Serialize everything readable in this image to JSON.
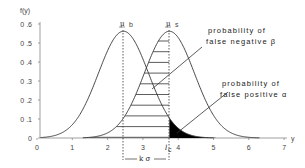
{
  "chart_data": {
    "type": "line",
    "title": "",
    "xlabel": "y",
    "ylabel": "f(y)",
    "xlim": [
      0,
      7
    ],
    "ylim": [
      0,
      0.6
    ],
    "x_ticks": [
      "0",
      "1",
      "2",
      "3",
      "4",
      "5",
      "6",
      "7"
    ],
    "y_ticks": [
      "0",
      "0.1",
      "0.2",
      "0.3",
      "0.4",
      "0.5",
      "0.6"
    ],
    "grid": false,
    "series": [
      {
        "name": "background distribution (mu b)",
        "mean": 2.45,
        "sd": 0.71,
        "peak": 0.56
      },
      {
        "name": "signal distribution (mu s)",
        "mean": 3.75,
        "sd": 0.71,
        "peak": 0.56
      }
    ],
    "critical_level": 3.75,
    "annotations": {
      "mu_b_label": "μ",
      "mu_b_sub": "b",
      "mu_s_label": "μ",
      "mu_s_sub": "s",
      "lc_label": "l",
      "lc_sub": "c",
      "k_sigma": "k σ",
      "beta_line1": "probability of",
      "beta_line2": "false negative β",
      "alpha_line1": "probability of",
      "alpha_line2": "false positive α"
    }
  }
}
